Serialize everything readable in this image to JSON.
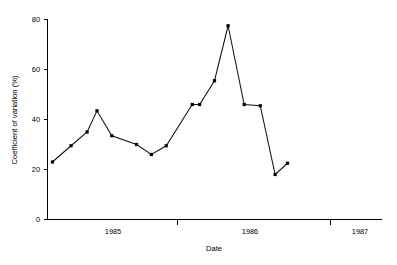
{
  "chart_data": {
    "type": "line",
    "title": "",
    "xlabel": "Date",
    "ylabel": "Coefficient of variation (%)",
    "xlim": [
      1984.62,
      1987.32
    ],
    "ylim": [
      0,
      80
    ],
    "grid": false,
    "legend": null,
    "y_ticks": [
      0,
      20,
      40,
      60,
      80
    ],
    "y_tick_labels": [
      "0",
      "20",
      "40",
      "60",
      "80"
    ],
    "x_tick_positions": [
      1985.0,
      1986.0,
      1987.0
    ],
    "x_category_labels": [
      "1985",
      "1986",
      "1987"
    ],
    "x_category_centers": [
      1984.85,
      1985.88,
      1986.93
    ],
    "marker": "square",
    "line_color": "#111111",
    "marker_color": "#000000",
    "background_color": "#ffffff",
    "x": [
      1984.66,
      1984.81,
      1984.94,
      1985.02,
      1985.14,
      1985.34,
      1985.46,
      1985.58,
      1985.79,
      1985.85,
      1985.97,
      1986.08,
      1986.21,
      1986.34,
      1986.46,
      1986.56
    ],
    "values": [
      23.0,
      29.5,
      35.0,
      43.5,
      33.5,
      30.0,
      26.0,
      29.5,
      46.0,
      46.0,
      55.5,
      77.5,
      46.0,
      45.5,
      18.0,
      22.5
    ],
    "series": [
      {
        "name": "Coefficient of variation",
        "values": [
          23.0,
          29.5,
          35.0,
          43.5,
          33.5,
          30.0,
          26.0,
          29.5,
          46.0,
          46.0,
          55.5,
          77.5,
          46.0,
          45.5,
          18.0,
          22.5
        ]
      }
    ]
  },
  "axes": {
    "y_label": "Coefficient of variation (%)",
    "x_label": "Date"
  }
}
